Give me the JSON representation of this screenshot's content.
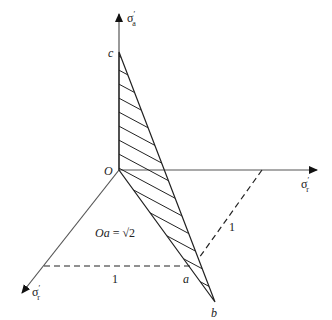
{
  "diagram": {
    "axes": {
      "vertical": {
        "label": "σ",
        "subscript": "a",
        "prime": "′"
      },
      "right": {
        "label": "σ",
        "subscript": "r",
        "prime": "′"
      },
      "diagonal": {
        "label": "σ",
        "subscript": "r",
        "prime": "′"
      }
    },
    "points": {
      "origin": "O",
      "c": "c",
      "a": "a",
      "b": "b"
    },
    "annotations": {
      "oa_equation_lhs": "Oa",
      "oa_equation_eq": " = ",
      "oa_equation_rhs": "√2",
      "horizontal_dashed_length": "1",
      "diagonal_dashed_length": "1"
    },
    "colors": {
      "line": "#333333",
      "axis": "#555555",
      "text": "#222222"
    }
  }
}
